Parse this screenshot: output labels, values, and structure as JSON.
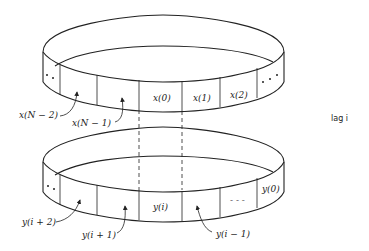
{
  "diagram": {
    "top_ring": {
      "name": "x buffer",
      "cells": [
        "..",
        "",
        "",
        "x(0)",
        "x(1)",
        "x(2)",
        "..."
      ],
      "callouts": [
        {
          "label": "x(N − 2)",
          "target_cell": 1
        },
        {
          "label": "x(N − 1)",
          "target_cell": 2
        }
      ]
    },
    "bottom_ring": {
      "name": "y buffer",
      "cells": [
        "..",
        "",
        "",
        "y(i)",
        "",
        "- - -",
        "y(0)"
      ],
      "callouts": [
        {
          "label": "y(i + 2)",
          "target_cell": 1
        },
        {
          "label": "y(i + 1)",
          "target_cell": 2
        },
        {
          "label": "y(i − 1)",
          "target_cell": 4
        }
      ]
    },
    "side_label": "lag i",
    "connector": "dashed lines aligning x(0) with y(i)"
  }
}
